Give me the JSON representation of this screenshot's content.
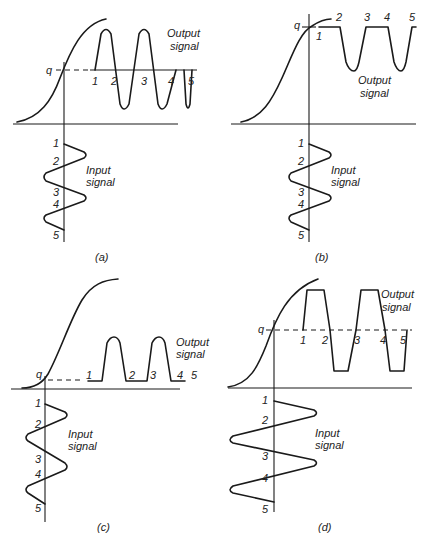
{
  "figure": {
    "panels": [
      {
        "id": "a",
        "caption": "(a)",
        "bias_label": "q",
        "output_label_line1": "Output",
        "output_label_line2": "signal",
        "input_label_line1": "Input",
        "input_label_line2": "signal",
        "output_markers": [
          "1",
          "2",
          "3",
          "4",
          "5"
        ],
        "input_markers": [
          "1",
          "2",
          "3",
          "4",
          "5"
        ],
        "description": "Bias point at center of linear region; output is a full undistorted sine wave"
      },
      {
        "id": "b",
        "caption": "(b)",
        "bias_label": "q",
        "output_label_line1": "Output",
        "output_label_line2": "signal",
        "input_label_line1": "Input",
        "input_label_line2": "signal",
        "output_markers": [
          "1",
          "2",
          "3",
          "4",
          "5"
        ],
        "input_markers": [
          "1",
          "2",
          "3",
          "4",
          "5"
        ],
        "description": "Bias point near saturation; positive half-cycles clipped"
      },
      {
        "id": "c",
        "caption": "(c)",
        "bias_label": "q",
        "output_label_line1": "Output",
        "output_label_line2": "signal",
        "input_label_line1": "Input",
        "input_label_line2": "signal",
        "output_markers": [
          "1",
          "2",
          "3",
          "4",
          "5"
        ],
        "input_markers": [
          "1",
          "2",
          "3",
          "4",
          "5"
        ],
        "description": "Bias point near cutoff; negative half-cycles clipped"
      },
      {
        "id": "d",
        "caption": "(d)",
        "bias_label": "q",
        "output_label_line1": "Output",
        "output_label_line2": "signal",
        "input_label_line1": "Input",
        "input_label_line2": "signal",
        "output_markers": [
          "1",
          "2",
          "3",
          "4",
          "5"
        ],
        "input_markers": [
          "1",
          "2",
          "3",
          "4",
          "5"
        ],
        "description": "Bias at center but input too large; both peaks clipped"
      }
    ]
  }
}
